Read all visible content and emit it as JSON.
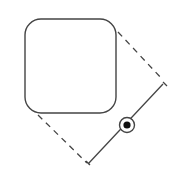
{
  "diagram": {
    "colors": {
      "stroke": "#444444",
      "background": "#ffffff"
    },
    "shape": {
      "type": "rounded-square"
    },
    "handle": {
      "type": "rotation-handle",
      "icon": "target-dot-icon"
    }
  }
}
